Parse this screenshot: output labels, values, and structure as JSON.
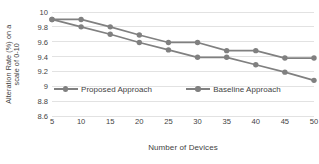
{
  "chart_data": {
    "type": "line",
    "title": "",
    "xlabel": "Number of Devices",
    "ylabel": "Alteration Rate (%) on a scale of 0-10",
    "ylabel_lines": [
      "Alteration Rate (%) on a",
      "scale of 0-10"
    ],
    "categories": [
      5,
      10,
      15,
      20,
      25,
      30,
      35,
      40,
      45,
      50
    ],
    "x_tick_labels": [
      "5",
      "10",
      "15",
      "20",
      "25",
      "30",
      "35",
      "40",
      "45",
      "50"
    ],
    "y_tick_labels": [
      "10",
      "9.8",
      "9.6",
      "9.4",
      "9.2",
      "9",
      "8.8",
      "8.6"
    ],
    "y_tick_values": [
      10,
      9.8,
      9.6,
      9.4,
      9.2,
      9,
      8.8,
      8.6
    ],
    "xlim": [
      5,
      50
    ],
    "ylim": [
      8.6,
      10
    ],
    "grid": "horizontal",
    "legend_position": "inside-middle-left",
    "series": [
      {
        "name": "Proposed Approach",
        "color": "#808080",
        "values": [
          9.9,
          9.9,
          9.8,
          9.69,
          9.59,
          9.59,
          9.48,
          9.48,
          9.38,
          9.38
        ]
      },
      {
        "name": "Baseline Approach",
        "color": "#808080",
        "values": [
          9.9,
          9.8,
          9.7,
          9.59,
          9.49,
          9.39,
          9.39,
          9.29,
          9.19,
          9.08
        ]
      }
    ]
  },
  "legend": {
    "entries": [
      {
        "label": "Proposed Approach"
      },
      {
        "label": "Baseline Approach"
      }
    ]
  },
  "style": {
    "line_color": "#808080",
    "marker_color": "#808080",
    "grid_color": "#e2e2e2",
    "text_color": "#3f3f3f",
    "background": "#ffffff"
  }
}
